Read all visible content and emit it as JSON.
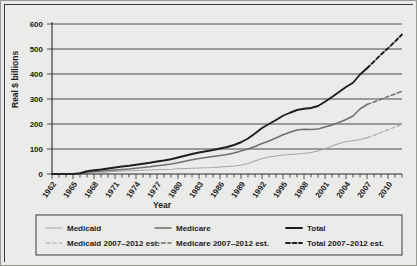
{
  "chart_data": {
    "type": "line",
    "title": "",
    "xlabel": "Year",
    "ylabel": "Real $ billions",
    "ylim": [
      0,
      600
    ],
    "yticks": [
      0,
      100,
      200,
      300,
      400,
      500,
      600
    ],
    "xlim": [
      1962,
      2012
    ],
    "xticks": [
      1962,
      1965,
      1968,
      1971,
      1974,
      1977,
      1980,
      1983,
      1986,
      1989,
      1992,
      1995,
      1998,
      2001,
      2004,
      2007,
      2010
    ],
    "tick_interval_years": 1,
    "grid": true,
    "legend_position": "bottom",
    "colors": {
      "medicaid": "#a8a8a6",
      "medicare": "#6f6f6d",
      "total": "#1f1f1d",
      "medicaid_est": "#a8a8a6",
      "medicare_est": "#6f6f6d",
      "total_est": "#1f1f1d"
    },
    "series": [
      {
        "name": "Medicaid",
        "style": "solid",
        "x": [
          1962,
          1963,
          1964,
          1965,
          1966,
          1967,
          1968,
          1969,
          1970,
          1971,
          1972,
          1973,
          1974,
          1975,
          1976,
          1977,
          1978,
          1979,
          1980,
          1981,
          1982,
          1983,
          1984,
          1985,
          1986,
          1987,
          1988,
          1989,
          1990,
          1991,
          1992,
          1993,
          1994,
          1995,
          1996,
          1997,
          1998,
          1999,
          2000,
          2001,
          2002,
          2003,
          2004,
          2005,
          2006,
          2007
        ],
        "values": [
          0,
          0,
          0,
          0,
          1,
          3,
          5,
          6,
          8,
          10,
          12,
          13,
          14,
          15,
          16,
          17,
          18,
          19,
          21,
          22,
          23,
          24,
          25,
          26,
          28,
          30,
          32,
          35,
          42,
          52,
          62,
          68,
          72,
          76,
          78,
          80,
          82,
          86,
          92,
          101,
          112,
          122,
          130,
          133,
          138,
          145
        ]
      },
      {
        "name": "Medicare",
        "style": "solid",
        "x": [
          1962,
          1963,
          1964,
          1965,
          1966,
          1967,
          1968,
          1969,
          1970,
          1971,
          1972,
          1973,
          1974,
          1975,
          1976,
          1977,
          1978,
          1979,
          1980,
          1981,
          1982,
          1983,
          1984,
          1985,
          1986,
          1987,
          1988,
          1989,
          1990,
          1991,
          1992,
          1993,
          1994,
          1995,
          1996,
          1997,
          1998,
          1999,
          2000,
          2001,
          2002,
          2003,
          2004,
          2005,
          2006,
          2007
        ],
        "values": [
          0,
          0,
          0,
          0,
          2,
          8,
          10,
          12,
          14,
          16,
          18,
          20,
          23,
          26,
          29,
          33,
          36,
          40,
          45,
          51,
          57,
          62,
          66,
          70,
          74,
          78,
          84,
          92,
          100,
          110,
          122,
          132,
          144,
          157,
          167,
          176,
          179,
          178,
          180,
          188,
          196,
          206,
          218,
          232,
          260,
          278
        ]
      },
      {
        "name": "Total",
        "style": "solid",
        "x": [
          1962,
          1963,
          1964,
          1965,
          1966,
          1967,
          1968,
          1969,
          1970,
          1971,
          1972,
          1973,
          1974,
          1975,
          1976,
          1977,
          1978,
          1979,
          1980,
          1981,
          1982,
          1983,
          1984,
          1985,
          1986,
          1987,
          1988,
          1989,
          1990,
          1991,
          1992,
          1993,
          1994,
          1995,
          1996,
          1997,
          1998,
          1999,
          2000,
          2001,
          2002,
          2003,
          2004,
          2005,
          2006,
          2007
        ],
        "values": [
          0,
          0,
          0,
          0,
          3,
          11,
          15,
          18,
          22,
          26,
          30,
          33,
          37,
          41,
          45,
          50,
          54,
          59,
          66,
          73,
          80,
          86,
          91,
          96,
          102,
          108,
          116,
          127,
          142,
          162,
          184,
          200,
          216,
          233,
          245,
          256,
          261,
          264,
          272,
          289,
          308,
          328,
          348,
          365,
          398,
          423
        ]
      },
      {
        "name": "Medicaid 2007–2012 est.",
        "style": "dashed",
        "x": [
          2007,
          2008,
          2009,
          2010,
          2011,
          2012
        ],
        "values": [
          145,
          155,
          166,
          177,
          188,
          199
        ]
      },
      {
        "name": "Medicare 2007–2012 est.",
        "style": "dashed",
        "x": [
          2007,
          2008,
          2009,
          2010,
          2011,
          2012
        ],
        "values": [
          278,
          288,
          299,
          310,
          320,
          331
        ]
      },
      {
        "name": "Total 2007–2012 est.",
        "style": "dashed",
        "x": [
          2007,
          2008,
          2009,
          2010,
          2011,
          2012
        ],
        "values": [
          423,
          450,
          478,
          503,
          530,
          558
        ]
      }
    ],
    "legend": [
      {
        "label": "Medicaid",
        "series": "medicaid",
        "style": "solid"
      },
      {
        "label": "Medicare",
        "series": "medicare",
        "style": "solid"
      },
      {
        "label": "Total",
        "series": "total",
        "style": "solid"
      },
      {
        "label": "Medicaid 2007–2012 est.",
        "series": "medicaid_est",
        "style": "dashed"
      },
      {
        "label": "Medicare 2007–2012 est.",
        "series": "medicare_est",
        "style": "dashed"
      },
      {
        "label": "Total 2007–2012 est.",
        "series": "total_est",
        "style": "dashed"
      }
    ]
  }
}
